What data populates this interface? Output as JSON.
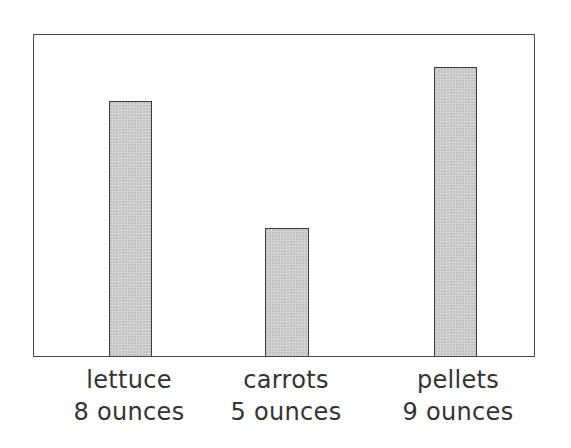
{
  "chart_data": {
    "type": "bar",
    "title": "",
    "xlabel": "",
    "ylabel": "",
    "categories": [
      "lettuce",
      "carrots",
      "pellets"
    ],
    "values": [
      8,
      5,
      9
    ],
    "unit": "ounces",
    "value_labels": [
      "8 ounces",
      "5 ounces",
      "9 ounces"
    ],
    "grid": false,
    "legend": null,
    "axis_ticks": false
  },
  "bars": [
    {
      "name": "lettuce",
      "amount_label": "8 ounces",
      "left": 75,
      "width": 43,
      "height": 255
    },
    {
      "name": "carrots",
      "amount_label": "5 ounces",
      "left": 231,
      "width": 44,
      "height": 128
    },
    {
      "name": "pellets",
      "amount_label": "9 ounces",
      "left": 400,
      "width": 43,
      "height": 289
    }
  ],
  "colors": {
    "bar_fill": "#d3d3d3",
    "bar_border": "#3c3c3c",
    "frame_border": "#4a4a4a",
    "text": "#333333"
  }
}
